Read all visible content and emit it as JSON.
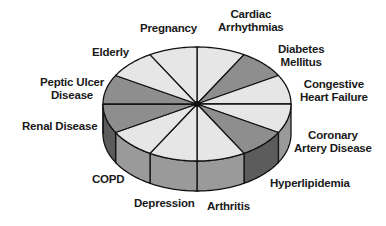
{
  "chart_data": {
    "type": "pie",
    "style": "3d",
    "title": "",
    "categories": [
      "Cardiac Arrhythmias",
      "Diabetes Mellitus",
      "Congestive Heart Failure",
      "Coronary Artery Disease",
      "Hyperlipidemia",
      "Arthritis",
      "Depression",
      "COPD",
      "Renal Disease",
      "Peptic Ulcer Disease",
      "Elderly",
      "Pregnancy"
    ],
    "values": [
      1,
      1,
      1,
      1,
      1,
      1,
      1,
      1,
      1,
      1,
      1,
      1
    ],
    "slice_shades": [
      "light",
      "dark",
      "light",
      "light",
      "dark",
      "light",
      "light",
      "light",
      "dark",
      "dark",
      "light",
      "light"
    ],
    "legend": "none (labels placed around pie)"
  },
  "colors": {
    "light_top": "#e6e6e6",
    "dark_top": "#8e8e8e",
    "light_side": "#9a9a9a",
    "dark_side": "#5c5c5c",
    "outline": "#111111"
  },
  "labels": {
    "pregnancy": [
      "Pregnancy"
    ],
    "cardiac": [
      "Cardiac",
      "Arrhythmias"
    ],
    "diabetes": [
      "Diabetes",
      "Mellitus"
    ],
    "chf": [
      "Congestive",
      "Heart Failure"
    ],
    "cad": [
      "Coronary",
      "Artery Disease"
    ],
    "hyperlipidemia": [
      "Hyperlipidemia"
    ],
    "arthritis": [
      "Arthritis"
    ],
    "depression": [
      "Depression"
    ],
    "copd": [
      "COPD"
    ],
    "renal": [
      "Renal Disease"
    ],
    "peptic": [
      "Peptic Ulcer",
      "Disease"
    ],
    "elderly": [
      "Elderly"
    ]
  }
}
